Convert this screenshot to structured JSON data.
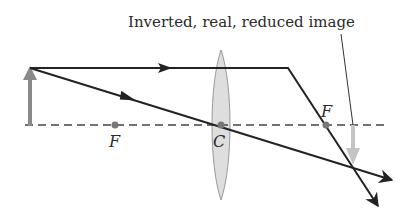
{
  "diagram": {
    "title_label": "Inverted, real, reduced image",
    "points": {
      "focal_left": {
        "label": "F"
      },
      "center": {
        "label": "C"
      },
      "focal_right": {
        "label": "F"
      }
    },
    "elements": {
      "object": "object-arrow (upright, gray)",
      "lens": "converging-lens",
      "image": "image-arrow (inverted, light gray)",
      "axis": "principal-axis (dashed)"
    },
    "rays": [
      {
        "name": "parallel-ray",
        "description": "parallel to axis, refracts through far focal point"
      },
      {
        "name": "central-ray",
        "description": "passes straight through lens center C"
      }
    ],
    "colors": {
      "ray": "#222222",
      "axis": "#444444",
      "object": "#8a8a8a",
      "image": "#c4c4c4",
      "lens_fill": "#dedede",
      "lens_stroke": "#9a9a9a",
      "point": "#777777"
    }
  }
}
